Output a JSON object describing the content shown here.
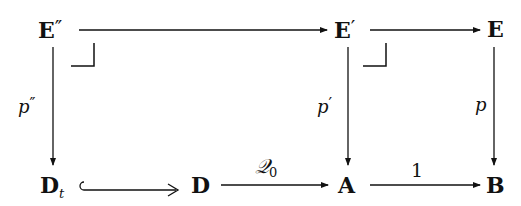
{
  "diagram": {
    "type": "commutative-diagram",
    "nodes": {
      "E_dprime": {
        "base": "E",
        "prime": "″"
      },
      "E_prime": {
        "base": "E",
        "prime": "′"
      },
      "E": {
        "base": "E"
      },
      "D_t": {
        "base": "D",
        "sub": "t"
      },
      "D": {
        "base": "D"
      },
      "A": {
        "base": "A"
      },
      "B": {
        "base": "B"
      }
    },
    "arrows": [
      {
        "from": "E''",
        "to": "E'",
        "label": ""
      },
      {
        "from": "E'",
        "to": "E",
        "label": ""
      },
      {
        "from": "E''",
        "to": "D_t",
        "label": "p''"
      },
      {
        "from": "E'",
        "to": "A",
        "label": "p'"
      },
      {
        "from": "E",
        "to": "B",
        "label": "p"
      },
      {
        "from": "D_t",
        "to": "D",
        "label": "",
        "style": "hook-inclusion"
      },
      {
        "from": "D",
        "to": "A",
        "label": "Q0"
      },
      {
        "from": "A",
        "to": "B",
        "label": "1"
      }
    ],
    "labels": {
      "p_dprime": {
        "base": "p",
        "prime": "″"
      },
      "p_prime": {
        "base": "p",
        "prime": "′"
      },
      "p": {
        "base": "p"
      },
      "Q0": {
        "base": "𝒬",
        "sub": "0"
      },
      "one": "1"
    },
    "pullback_marks": 2
  }
}
